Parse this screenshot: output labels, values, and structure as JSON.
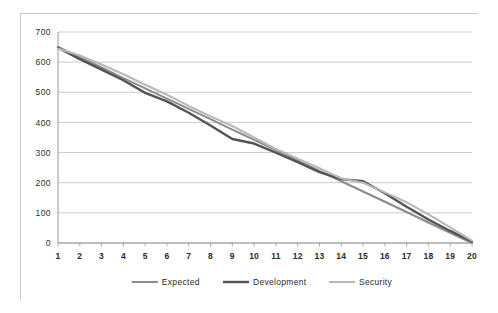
{
  "chart_data": {
    "type": "line",
    "title": "",
    "xlabel": "",
    "ylabel": "",
    "xlim": [
      1,
      20
    ],
    "ylim": [
      0,
      700
    ],
    "ytick_labels": [
      "0",
      "100",
      "200",
      "300",
      "400",
      "500",
      "600",
      "700"
    ],
    "yticks": [
      0,
      100,
      200,
      300,
      400,
      500,
      600,
      700
    ],
    "x": [
      1,
      2,
      3,
      4,
      5,
      6,
      7,
      8,
      9,
      10,
      11,
      12,
      13,
      14,
      15,
      16,
      17,
      18,
      19,
      20
    ],
    "xtick_labels": [
      "1",
      "2",
      "3",
      "4",
      "5",
      "6",
      "7",
      "8",
      "9",
      "10",
      "11",
      "12",
      "13",
      "14",
      "15",
      "16",
      "17",
      "18",
      "19",
      "20"
    ],
    "grid": true,
    "grid_axis": "y",
    "legend_position": "bottom",
    "series": [
      {
        "name": "Expected",
        "color": "#8c8c8c",
        "width": 2.1,
        "values": [
          650,
          616,
          582,
          547,
          513,
          479,
          445,
          411,
          376,
          342,
          308,
          274,
          239,
          205,
          171,
          137,
          103,
          68,
          34,
          0
        ]
      },
      {
        "name": "Development",
        "color": "#545454",
        "width": 2.4,
        "values": [
          648,
          610,
          575,
          540,
          498,
          470,
          432,
          390,
          345,
          330,
          300,
          268,
          235,
          212,
          205,
          165,
          120,
          78,
          40,
          5
        ]
      },
      {
        "name": "Security",
        "color": "#b9b9b9",
        "width": 2.1,
        "values": [
          645,
          622,
          592,
          560,
          525,
          492,
          455,
          420,
          388,
          350,
          312,
          280,
          248,
          215,
          200,
          168,
          135,
          95,
          52,
          8
        ]
      }
    ]
  },
  "legend": {
    "items": [
      {
        "label": "Expected"
      },
      {
        "label": "Development"
      },
      {
        "label": "Security"
      }
    ]
  },
  "colors": {
    "plot_background": "#ffffff",
    "frame_border": "#c8c8c8",
    "gridline": "#b6b6b6",
    "axis": "#8d8d8d",
    "tick_text": "#2b2b2b"
  }
}
